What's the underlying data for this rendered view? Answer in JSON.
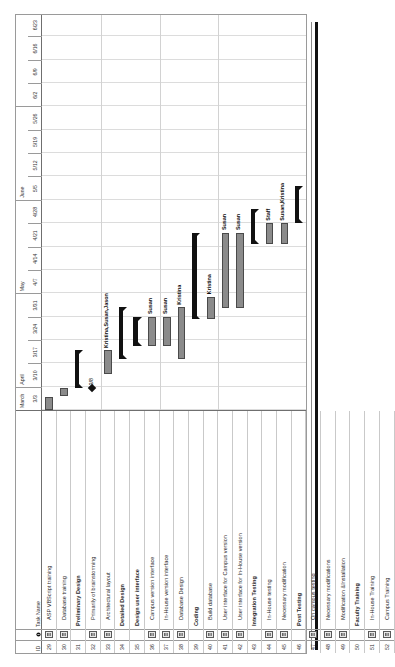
{
  "chart_data": {
    "type": "bar",
    "chart_kind": "gantt",
    "xlabel": "",
    "ylabel": "",
    "grid": true,
    "axis_range": [
      "3/3",
      "6/23"
    ],
    "months": [
      {
        "label": "March",
        "weeks": 1
      },
      {
        "label": "April",
        "weeks": 4
      },
      {
        "label": "May",
        "weeks": 4
      },
      {
        "label": "June",
        "weeks": 4
      }
    ],
    "week_ticks": [
      "3/3",
      "3/10",
      "3/17",
      "3/24",
      "3/31",
      "4/7",
      "4/14",
      "4/21",
      "4/28",
      "5/5",
      "5/12",
      "5/19",
      "5/26",
      "6/2",
      "6/9",
      "6/16",
      "6/23"
    ],
    "columns": [
      "ID",
      "i",
      "Task Name"
    ],
    "tasks": [
      {
        "id": "29",
        "level": 1,
        "name": "ASP VBScript training",
        "type": "task",
        "note": true,
        "start": 0.0,
        "end": 0.55,
        "resources": ""
      },
      {
        "id": "30",
        "level": 1,
        "name": "Database training",
        "type": "task",
        "note": true,
        "start": 0.6,
        "end": 0.95,
        "resources": ""
      },
      {
        "id": "31",
        "level": 0,
        "name": "Preliminary Design",
        "type": "summary",
        "note": false,
        "start": 0.95,
        "end": 2.55,
        "resources": ""
      },
      {
        "id": "32",
        "level": 1,
        "name": "Primarily of brainstorming",
        "type": "milestone",
        "note": true,
        "start": 0.95,
        "end": 0.95,
        "resources": "3/8"
      },
      {
        "id": "33",
        "level": 1,
        "name": "Architectural layout",
        "type": "task",
        "note": true,
        "start": 1.55,
        "end": 2.55,
        "resources": "Kristina,Susan,Jason"
      },
      {
        "id": "34",
        "level": 0,
        "name": "Detailed Design",
        "type": "summary",
        "note": false,
        "start": 2.2,
        "end": 4.4,
        "resources": ""
      },
      {
        "id": "35",
        "level": 0,
        "name": "Design user interface",
        "type": "summary",
        "note": false,
        "start": 2.75,
        "end": 4.0,
        "resources": ""
      },
      {
        "id": "36",
        "level": 1,
        "name": "Campus version interface",
        "type": "task",
        "note": true,
        "start": 2.75,
        "end": 4.0,
        "resources": "Susan"
      },
      {
        "id": "37",
        "level": 1,
        "name": "In-House version interface",
        "type": "task",
        "note": true,
        "start": 2.75,
        "end": 4.0,
        "resources": "Susan"
      },
      {
        "id": "38",
        "level": 1,
        "name": "Database Design",
        "type": "task",
        "note": true,
        "start": 2.2,
        "end": 4.4,
        "resources": "Kristina"
      },
      {
        "id": "39",
        "level": 0,
        "name": "Coding",
        "type": "summary",
        "note": false,
        "start": 3.9,
        "end": 7.6,
        "resources": ""
      },
      {
        "id": "40",
        "level": 1,
        "name": "Build database",
        "type": "task",
        "note": true,
        "start": 3.9,
        "end": 4.85,
        "resources": "Kristina"
      },
      {
        "id": "41",
        "level": 1,
        "name": "User interface for Campus version",
        "type": "task",
        "note": true,
        "start": 4.35,
        "end": 7.6,
        "resources": "Susan"
      },
      {
        "id": "42",
        "level": 1,
        "name": "User interface for In-House version",
        "type": "task",
        "note": true,
        "start": 4.35,
        "end": 7.6,
        "resources": "Susan"
      },
      {
        "id": "43",
        "level": 0,
        "name": "Integration Testing",
        "type": "summary",
        "note": false,
        "start": 7.1,
        "end": 8.6,
        "resources": ""
      },
      {
        "id": "44",
        "level": 1,
        "name": "In-House testing",
        "type": "task",
        "note": true,
        "start": 7.1,
        "end": 8.0,
        "resources": "Staff"
      },
      {
        "id": "45",
        "level": 1,
        "name": "Necessary modification",
        "type": "task",
        "note": true,
        "start": 7.1,
        "end": 8.0,
        "resources": "Susan,Kristina"
      },
      {
        "id": "46",
        "level": 0,
        "name": "Post Testing",
        "type": "summary",
        "note": false,
        "start": 8.0,
        "end": 9.6,
        "resources": ""
      },
      {
        "id": "47",
        "level": 1,
        "name": "On campus testing",
        "type": "task",
        "note": true,
        "start": 8.0,
        "end": 8.9,
        "resources": "Faculty"
      },
      {
        "id": "48",
        "level": 1,
        "name": "Necessary modifications",
        "type": "task",
        "note": true,
        "start": 8.0,
        "end": 8.9,
        "resources": "Susan,Kristina"
      },
      {
        "id": "49",
        "level": 1,
        "name": "Modification &Installation",
        "type": "task",
        "note": true,
        "start": 8.9,
        "end": 9.5,
        "resources": "Susan"
      },
      {
        "id": "50",
        "level": 0,
        "name": "Faculty Training",
        "type": "summary",
        "note": false,
        "start": 9.3,
        "end": 10.4,
        "resources": ""
      },
      {
        "id": "51",
        "level": 1,
        "name": "In-House Training",
        "type": "task",
        "note": true,
        "start": 9.5,
        "end": 9.95,
        "resources": "Jason"
      },
      {
        "id": "52",
        "level": 1,
        "name": "Campus Training",
        "type": "task",
        "note": true,
        "start": 9.95,
        "end": 10.4,
        "resources": "Jason"
      }
    ]
  },
  "table": {
    "header": {
      "id": "ID",
      "indicator_icon": "info-circle-icon",
      "task_name": "Task Name"
    }
  },
  "colors": {
    "bar_fill": "#8b8b8b",
    "bar_border": "#4a4a4a",
    "summary": "#111111",
    "grid": "#d2d2d2",
    "frame": "#6f6f6f",
    "text": "#2b2b2b"
  }
}
